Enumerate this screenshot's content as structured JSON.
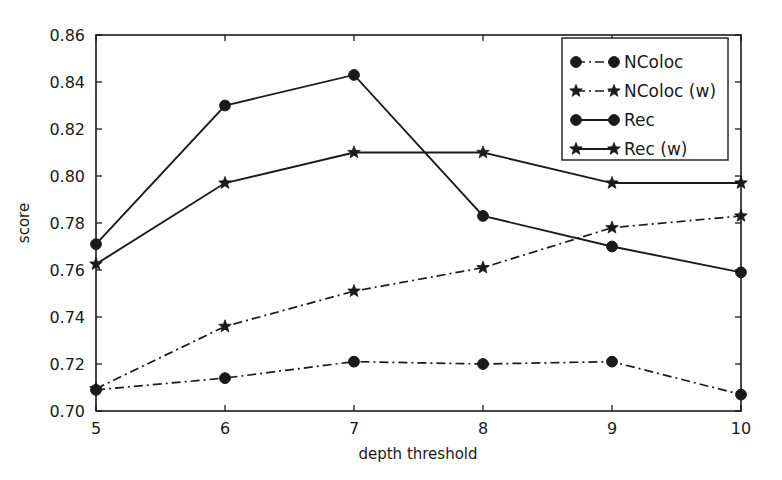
{
  "chart_data": {
    "type": "line",
    "title": "",
    "xlabel": "depth threshold",
    "ylabel": "score",
    "x": [
      5,
      6,
      7,
      8,
      9,
      10
    ],
    "xlim": [
      5,
      10
    ],
    "ylim": [
      0.7,
      0.86
    ],
    "xticks": [
      "5",
      "6",
      "7",
      "8",
      "9",
      "10"
    ],
    "yticks": [
      "0.70",
      "0.72",
      "0.74",
      "0.76",
      "0.78",
      "0.80",
      "0.82",
      "0.84",
      "0.86"
    ],
    "ytick_values": [
      0.7,
      0.72,
      0.74,
      0.76,
      0.78,
      0.8,
      0.82,
      0.84,
      0.86
    ],
    "grid": false,
    "legend_position": "upper right",
    "series": [
      {
        "name": "NColoc",
        "values": [
          0.709,
          0.714,
          0.721,
          0.72,
          0.721,
          0.707
        ],
        "linestyle": "dashdot",
        "marker": "circle",
        "color": "#1a1a1a"
      },
      {
        "name": "NColoc (w)",
        "values": [
          0.7095,
          0.736,
          0.751,
          0.761,
          0.778,
          0.783
        ],
        "linestyle": "dashdot",
        "marker": "star",
        "color": "#1a1a1a"
      },
      {
        "name": "Rec",
        "values": [
          0.771,
          0.83,
          0.843,
          0.783,
          0.77,
          0.759
        ],
        "linestyle": "solid",
        "marker": "circle",
        "color": "#1a1a1a"
      },
      {
        "name": "Rec (w)",
        "values": [
          0.7625,
          0.797,
          0.81,
          0.81,
          0.797,
          0.797
        ],
        "linestyle": "solid",
        "marker": "star",
        "color": "#1a1a1a"
      }
    ]
  },
  "legend": {
    "entries": [
      {
        "label": "NColoc"
      },
      {
        "label": "NColoc (w)"
      },
      {
        "label": "Rec"
      },
      {
        "label": "Rec (w)"
      }
    ]
  }
}
